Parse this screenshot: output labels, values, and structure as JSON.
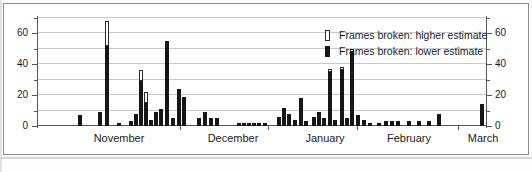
{
  "chart_data": {
    "type": "bar",
    "title": "",
    "subtitle": "",
    "xlabel": "",
    "ylabel": "",
    "ylim": [
      0,
      70
    ],
    "yticks_major": [
      0,
      20,
      40,
      60
    ],
    "yticks_minor": [
      10,
      30,
      50
    ],
    "grid": true,
    "dual_axis": true,
    "legend_position": "top-right",
    "legend": [
      {
        "key": "higher",
        "label": "Frames broken: higher estimate",
        "style": "outlined-white"
      },
      {
        "key": "lower",
        "label": "Frames broken: lower estimate",
        "style": "solid-black"
      }
    ],
    "month_labels": [
      "November",
      "December",
      "January",
      "February",
      "March"
    ],
    "month_label_x": [
      82,
      196,
      288,
      372,
      446
    ],
    "month_boundary_x": [
      143,
      231,
      320,
      421
    ],
    "series": [
      {
        "name": "Frames broken: lower estimate",
        "key": "lower"
      },
      {
        "name": "Frames broken: higher estimate",
        "key": "higher"
      }
    ],
    "bars": [
      {
        "x": 41,
        "lower": 7,
        "higher": 7
      },
      {
        "x": 61,
        "lower": 9,
        "higher": 9
      },
      {
        "x": 68,
        "lower": 52,
        "higher": 68
      },
      {
        "x": 80,
        "lower": 2,
        "higher": 2
      },
      {
        "x": 92,
        "lower": 3,
        "higher": 3
      },
      {
        "x": 97,
        "lower": 8,
        "higher": 8
      },
      {
        "x": 102,
        "lower": 29,
        "higher": 36
      },
      {
        "x": 107,
        "lower": 15,
        "higher": 22
      },
      {
        "x": 112,
        "lower": 4,
        "higher": 4
      },
      {
        "x": 117,
        "lower": 9,
        "higher": 9
      },
      {
        "x": 122,
        "lower": 11,
        "higher": 11
      },
      {
        "x": 128,
        "lower": 55,
        "higher": 55
      },
      {
        "x": 134,
        "lower": 5,
        "higher": 5
      },
      {
        "x": 140,
        "lower": 24,
        "higher": 24
      },
      {
        "x": 145,
        "lower": 19,
        "higher": 19
      },
      {
        "x": 160,
        "lower": 5,
        "higher": 5
      },
      {
        "x": 166,
        "lower": 9,
        "higher": 9
      },
      {
        "x": 172,
        "lower": 5,
        "higher": 5
      },
      {
        "x": 178,
        "lower": 5,
        "higher": 5
      },
      {
        "x": 200,
        "lower": 2,
        "higher": 2
      },
      {
        "x": 205,
        "lower": 2,
        "higher": 2
      },
      {
        "x": 210,
        "lower": 2,
        "higher": 2
      },
      {
        "x": 215,
        "lower": 2,
        "higher": 2
      },
      {
        "x": 220,
        "lower": 2,
        "higher": 2
      },
      {
        "x": 226,
        "lower": 2,
        "higher": 2
      },
      {
        "x": 240,
        "lower": 6,
        "higher": 6
      },
      {
        "x": 245,
        "lower": 12,
        "higher": 12
      },
      {
        "x": 250,
        "lower": 8,
        "higher": 8
      },
      {
        "x": 256,
        "lower": 4,
        "higher": 4
      },
      {
        "x": 262,
        "lower": 18,
        "higher": 18
      },
      {
        "x": 267,
        "lower": 3,
        "higher": 3
      },
      {
        "x": 275,
        "lower": 6,
        "higher": 6
      },
      {
        "x": 280,
        "lower": 9,
        "higher": 9
      },
      {
        "x": 285,
        "lower": 5,
        "higher": 5
      },
      {
        "x": 291,
        "lower": 35,
        "higher": 37
      },
      {
        "x": 296,
        "lower": 4,
        "higher": 4
      },
      {
        "x": 303,
        "lower": 36,
        "higher": 38
      },
      {
        "x": 308,
        "lower": 5,
        "higher": 5
      },
      {
        "x": 313,
        "lower": 48,
        "higher": 50
      },
      {
        "x": 319,
        "lower": 7,
        "higher": 7
      },
      {
        "x": 325,
        "lower": 4,
        "higher": 4
      },
      {
        "x": 331,
        "lower": 2,
        "higher": 2
      },
      {
        "x": 340,
        "lower": 2,
        "higher": 2
      },
      {
        "x": 347,
        "lower": 3,
        "higher": 3
      },
      {
        "x": 353,
        "lower": 3,
        "higher": 3
      },
      {
        "x": 359,
        "lower": 3,
        "higher": 3
      },
      {
        "x": 370,
        "lower": 3,
        "higher": 3
      },
      {
        "x": 380,
        "lower": 3,
        "higher": 3
      },
      {
        "x": 390,
        "lower": 3,
        "higher": 3
      },
      {
        "x": 400,
        "lower": 8,
        "higher": 8
      },
      {
        "x": 443,
        "lower": 14,
        "higher": 14
      }
    ]
  }
}
